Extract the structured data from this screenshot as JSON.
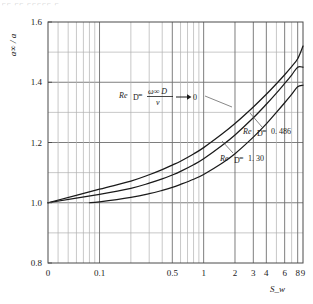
{
  "figure": {
    "top_fragment": "⌐⌐ ⌐⌐  ⌐⌐⌐⌐⌐ ⌐",
    "background_color": "#ffffff",
    "line_color": "#1a1a1a",
    "grid_color": "#8a8a8a"
  },
  "chart_data": {
    "type": "line",
    "title": "",
    "xlabel": "S_w",
    "ylabel": "a∞ / a",
    "xscale": "log-shifted",
    "yscale": "linear",
    "xlim": [
      0,
      9
    ],
    "ylim": [
      0.8,
      1.6
    ],
    "grid": true,
    "legend_position": "inline-annotations",
    "y_ticks": [
      "1.6",
      "1.4",
      "1.2",
      "1.0",
      "0.8"
    ],
    "y_tick_values": [
      1.6,
      1.4,
      1.2,
      1.0,
      0.8
    ],
    "y_minor_values": [
      1.5,
      1.3,
      1.1,
      0.9
    ],
    "x_ticks": [
      "0",
      "0.1",
      "0.5",
      "1",
      "2",
      "3",
      "4",
      "6",
      "8",
      "9"
    ],
    "x_tick_values": [
      0,
      0.1,
      0.5,
      1,
      2,
      3,
      4,
      6,
      8,
      9
    ],
    "x_minor_values": [
      0.2,
      0.3,
      0.4,
      0.6,
      0.7,
      0.8,
      0.9,
      5,
      7
    ],
    "series": [
      {
        "name": "Re_D = ω∞D/ν → 0",
        "label_text": "Re",
        "label_sub": "D",
        "label_eq": "=",
        "label_num": "ω∞ D",
        "label_den": "ν",
        "label_arrow": "0",
        "x": [
          0,
          0.1,
          0.2,
          0.3,
          0.4,
          0.5,
          0.6,
          0.8,
          1,
          1.5,
          2,
          3,
          4,
          5,
          6,
          7,
          8,
          9
        ],
        "y": [
          1.0,
          1.045,
          1.072,
          1.093,
          1.11,
          1.125,
          1.138,
          1.162,
          1.183,
          1.228,
          1.263,
          1.318,
          1.36,
          1.395,
          1.425,
          1.452,
          1.478,
          1.52
        ]
      },
      {
        "name": "Re_D = 0.486",
        "label_text": "Re",
        "label_sub": "D",
        "label_eq": "=",
        "label_value": "0. 486",
        "x": [
          0,
          0.1,
          0.2,
          0.3,
          0.4,
          0.5,
          0.6,
          0.8,
          1,
          1.5,
          2,
          3,
          4,
          5,
          6,
          7,
          8,
          9
        ],
        "y": [
          1.0,
          1.028,
          1.048,
          1.065,
          1.079,
          1.092,
          1.104,
          1.126,
          1.146,
          1.19,
          1.225,
          1.282,
          1.327,
          1.364,
          1.396,
          1.424,
          1.45,
          1.45
        ]
      },
      {
        "name": "Re_D = 1.30",
        "label_text": "Re",
        "label_sub": "D",
        "label_eq": "=",
        "label_value": "1. 30",
        "x": [
          0.08,
          0.1,
          0.2,
          0.3,
          0.4,
          0.5,
          0.6,
          0.8,
          1,
          1.5,
          2,
          3,
          4,
          5,
          6,
          7,
          8,
          9
        ],
        "y": [
          1.0,
          1.003,
          1.018,
          1.03,
          1.041,
          1.051,
          1.061,
          1.078,
          1.094,
          1.131,
          1.163,
          1.218,
          1.262,
          1.3,
          1.332,
          1.36,
          1.385,
          1.39
        ]
      }
    ],
    "annotations": [
      {
        "id": "annot-re-zero",
        "text": "Re_D = ω∞D/ν → 0"
      },
      {
        "id": "annot-re-0486",
        "text": "Re_D = 0. 486"
      },
      {
        "id": "annot-re-130",
        "text": "Re_D = 1. 30"
      }
    ]
  }
}
